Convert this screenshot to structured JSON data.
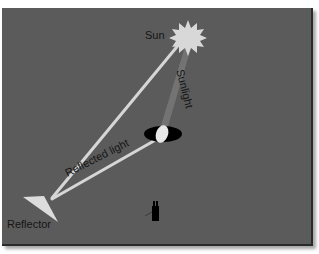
{
  "diagram": {
    "title": "",
    "background_color": "#5b5b5b",
    "labels": {
      "sun": "Sun",
      "sunlight": "Sunlight",
      "reflected_light": "Reflected light",
      "reflector": "Reflector"
    },
    "elements": [
      {
        "name": "sun",
        "shape": "starburst",
        "color": "#d8d8d8"
      },
      {
        "name": "sunlight-beam",
        "shape": "band",
        "color": "#7a7a7a",
        "from": "sun",
        "to": "eye-lens"
      },
      {
        "name": "reflected-light-ray-to-sun",
        "shape": "line",
        "color": "#d9d9d9",
        "from": "reflector",
        "to": "sun"
      },
      {
        "name": "reflected-light-ray-to-eye",
        "shape": "line",
        "color": "#d9d9d9",
        "from": "reflector",
        "to": "eye-lens"
      },
      {
        "name": "eye",
        "shape": "ellipse",
        "color": "#000000"
      },
      {
        "name": "eye-lens",
        "shape": "oval",
        "color": "#e6e6e6"
      },
      {
        "name": "reflector",
        "shape": "triangle",
        "color": "#dcdcdc"
      },
      {
        "name": "observer-figure",
        "shape": "silhouette",
        "color": "#000000"
      }
    ]
  }
}
